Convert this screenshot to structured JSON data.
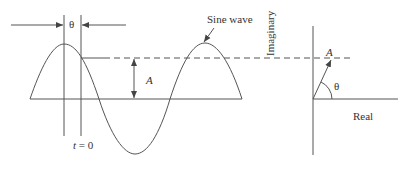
{
  "diagram": {
    "labels": {
      "theta_top": "θ",
      "sine_wave": "Sine wave",
      "amplitude": "A",
      "t_zero": "t = 0",
      "imaginary": "Imaginary",
      "phasor_amplitude": "A",
      "phasor_angle": "θ",
      "real": "Real"
    },
    "colors": {
      "stroke": "#555555",
      "text": "#333333",
      "background": "#ffffff"
    }
  }
}
